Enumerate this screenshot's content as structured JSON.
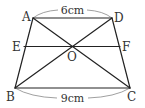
{
  "figure": {
    "type": "trapezoid",
    "stroke_color": "#222222",
    "guide_color": "#888888",
    "vertices": {
      "A": {
        "label": "A",
        "x": 33,
        "y": 18
      },
      "D": {
        "label": "D",
        "x": 112,
        "y": 18
      },
      "B": {
        "label": "B",
        "x": 15,
        "y": 88
      },
      "C": {
        "label": "C",
        "x": 130,
        "y": 88
      }
    },
    "points": {
      "E": {
        "label": "E",
        "x": 24,
        "y": 46.5
      },
      "F": {
        "label": "F",
        "x": 120,
        "y": 46.5
      },
      "O": {
        "label": "O",
        "x": 72,
        "y": 46.5
      }
    },
    "segments": [
      {
        "name": "AD",
        "from": "A",
        "to": "D"
      },
      {
        "name": "BC",
        "from": "B",
        "to": "C"
      },
      {
        "name": "AB",
        "from": "A",
        "to": "B"
      },
      {
        "name": "DC",
        "from": "D",
        "to": "C"
      },
      {
        "name": "AC",
        "from": "A",
        "to": "C"
      },
      {
        "name": "BD",
        "from": "B",
        "to": "D"
      },
      {
        "name": "EF",
        "from": "E",
        "to": "F"
      }
    ],
    "dimensions": {
      "top": {
        "label": "6cm",
        "segment": "AD"
      },
      "bottom": {
        "label": "9cm",
        "segment": "BC"
      }
    }
  }
}
